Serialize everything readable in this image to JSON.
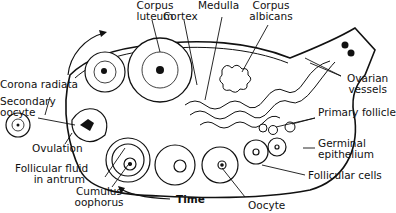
{
  "diagram": {
    "labels": {
      "corpus_luteum": [
        "Corpus",
        "luteum"
      ],
      "cortex": "Cortex",
      "medulla": "Medulla",
      "corpus_albicans": [
        "Corpus",
        "albicans"
      ],
      "ovarian_vessels": [
        "Ovarian",
        "vessels"
      ],
      "primary_follicle": "Primary follicle",
      "germinal_epithelium": [
        "Germinal",
        "epithelium"
      ],
      "follicular_cells": "Follicular cells",
      "oocyte": "Oocyte",
      "time": "Time",
      "cumulus_oophorus": [
        "Cumulus",
        "oophorus"
      ],
      "follicular_fluid": [
        "Follicular fluid",
        "in antrum"
      ],
      "ovulation": "Ovulation",
      "secondary_oocyte": [
        "Secondary",
        "oocyte"
      ],
      "corona_radiata": "Corona radiata"
    },
    "colors": {
      "ink": "#111111",
      "background": "#ffffff"
    }
  }
}
